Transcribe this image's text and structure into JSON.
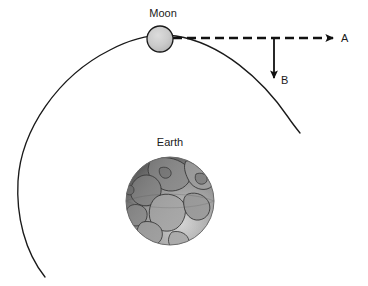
{
  "figure": {
    "type": "physics-orbit-diagram",
    "background_color": "#ffffff",
    "width": 368,
    "height": 286
  },
  "bodies": {
    "moon": {
      "label": "Moon",
      "center_x": 160,
      "center_y": 39,
      "radius": 13,
      "fill_color": "#c9c9c9",
      "stroke_color": "#1a1a1a"
    },
    "earth": {
      "label": "Earth",
      "center_x": 170,
      "center_y": 201,
      "radius": 44,
      "fill_color": "#9a9a9a",
      "stroke_color": "#6e6e6e"
    }
  },
  "orbit": {
    "name": "moon-orbit-path",
    "stroke_color": "#1a1a1a",
    "stroke_width": 1.3,
    "description": "open elliptical arc around Earth passing through the Moon"
  },
  "vectors": [
    {
      "id": "A",
      "label": "A",
      "style": "dashed",
      "direction": "right",
      "start_x": 173,
      "start_y": 38,
      "end_x": 336,
      "end_y": 38,
      "color": "#111111"
    },
    {
      "id": "B",
      "label": "B",
      "style": "solid",
      "direction": "down",
      "start_x": 274,
      "start_y": 38,
      "end_x": 274,
      "end_y": 80,
      "color": "#111111"
    }
  ]
}
